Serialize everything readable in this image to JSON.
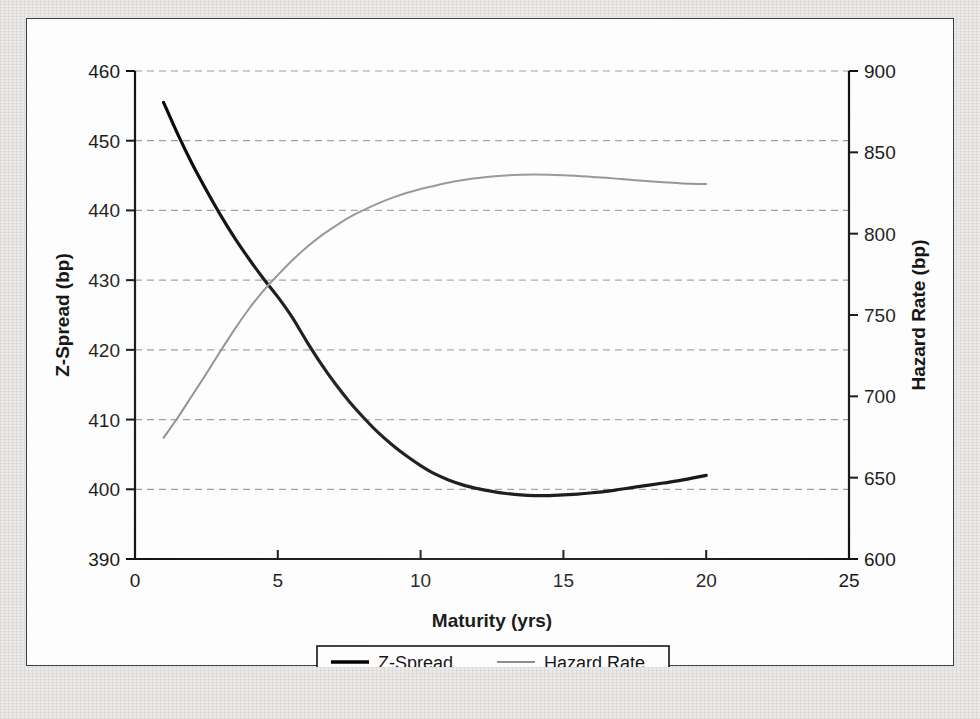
{
  "figure": {
    "background_color": "#eceae8",
    "panel_color": "#fdfdfd",
    "panel_border_color": "#3c3c3c"
  },
  "chart_data": {
    "type": "line",
    "title": "",
    "subtitle": "",
    "xlabel": "Maturity (yrs)",
    "ylabel": "Z-Spread (bp)",
    "y2label": "Hazard Rate (bp)",
    "xlim": [
      0,
      25
    ],
    "ylim": [
      390,
      460
    ],
    "y2lim": [
      600,
      900
    ],
    "xticks": [
      0,
      5,
      10,
      15,
      20,
      25
    ],
    "xtick_labels": [
      "0",
      "5",
      "10",
      "15",
      "20",
      "25"
    ],
    "yticks": [
      390,
      400,
      410,
      420,
      430,
      440,
      450,
      460
    ],
    "ytick_labels": [
      "390",
      "400",
      "410",
      "420",
      "430",
      "440",
      "450",
      "460"
    ],
    "y2ticks": [
      600,
      650,
      700,
      750,
      800,
      850,
      900
    ],
    "y2tick_labels": [
      "600",
      "650",
      "700",
      "750",
      "800",
      "850",
      "900"
    ],
    "grid": true,
    "grid_style": "dashed",
    "grid_color": "#9a9a9a",
    "legend_position": "below-center",
    "legend_border": true,
    "series": [
      {
        "name": "Z-Spread",
        "axis": "left",
        "color": "#000000",
        "line_width": 3.2,
        "x": [
          1,
          1.5,
          2,
          2.5,
          3,
          3.5,
          4,
          4.5,
          5,
          5.5,
          6,
          6.5,
          7,
          7.5,
          8,
          8.5,
          9,
          9.5,
          10,
          10.5,
          11,
          11.5,
          12,
          12.5,
          13,
          13.5,
          14,
          14.5,
          15,
          15.5,
          16,
          16.5,
          17,
          17.5,
          18,
          18.5,
          19,
          19.5,
          20
        ],
        "values": [
          455.5,
          450.9,
          446.7,
          442.9,
          439.3,
          436.0,
          433.0,
          430.2,
          427.6,
          424.7,
          421.3,
          418.1,
          415.2,
          412.6,
          410.3,
          408.2,
          406.4,
          404.8,
          403.4,
          402.2,
          401.3,
          400.6,
          400.1,
          399.7,
          399.4,
          399.2,
          399.1,
          399.1,
          399.2,
          399.3,
          399.5,
          399.7,
          400.0,
          400.3,
          400.6,
          400.9,
          401.2,
          401.6,
          402.0
        ]
      },
      {
        "name": "Hazard Rate",
        "axis": "right",
        "color": "#8a8a8a",
        "line_width": 2.0,
        "x": [
          1,
          1.5,
          2,
          2.5,
          3,
          3.5,
          4,
          4.5,
          5,
          5.5,
          6,
          6.5,
          7,
          7.5,
          8,
          8.5,
          9,
          9.5,
          10,
          10.5,
          11,
          11.5,
          12,
          12.5,
          13,
          13.5,
          14,
          14.5,
          15,
          15.5,
          16,
          16.5,
          17,
          17.5,
          18,
          18.5,
          19,
          19.5,
          20
        ],
        "values": [
          674.5,
          687.0,
          700.5,
          714.0,
          728.0,
          741.5,
          754.0,
          765.0,
          774.5,
          783.5,
          791.5,
          798.5,
          804.5,
          810.0,
          814.5,
          818.5,
          822.0,
          825.0,
          827.5,
          829.5,
          831.5,
          833.0,
          834.2,
          835.2,
          835.8,
          836.2,
          836.3,
          836.2,
          835.9,
          835.5,
          834.9,
          834.3,
          833.6,
          832.9,
          832.2,
          831.6,
          831.1,
          830.7,
          830.5
        ]
      }
    ],
    "legend": [
      {
        "label": "Z-Spread",
        "color": "#000000",
        "style": "solid-thick"
      },
      {
        "label": "Hazard Rate",
        "color": "#8a8a8a",
        "style": "solid-thin"
      }
    ]
  }
}
